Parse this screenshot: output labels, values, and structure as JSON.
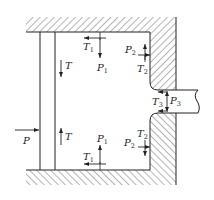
{
  "diagram": {
    "type": "force-diagram",
    "labels": {
      "P_left": {
        "main": "P",
        "sub": ""
      },
      "T_plate_top": {
        "main": "T",
        "sub": ""
      },
      "T_plate_bottom": {
        "main": "T",
        "sub": ""
      },
      "T1_top": {
        "main": "T",
        "sub": "1"
      },
      "P1_top": {
        "main": "P",
        "sub": "1"
      },
      "P2_top": {
        "main": "P",
        "sub": "2"
      },
      "T2_top": {
        "main": "T",
        "sub": "2"
      },
      "T3": {
        "main": "T",
        "sub": "3"
      },
      "P3": {
        "main": "P",
        "sub": "3"
      },
      "P1_bottom": {
        "main": "P",
        "sub": "1"
      },
      "T1_bottom": {
        "main": "T",
        "sub": "1"
      },
      "P2_bottom": {
        "main": "P",
        "sub": "2"
      },
      "T2_bottom": {
        "main": "T",
        "sub": "2"
      }
    },
    "colors": {
      "stroke": "#222222",
      "background": "#ffffff"
    }
  }
}
